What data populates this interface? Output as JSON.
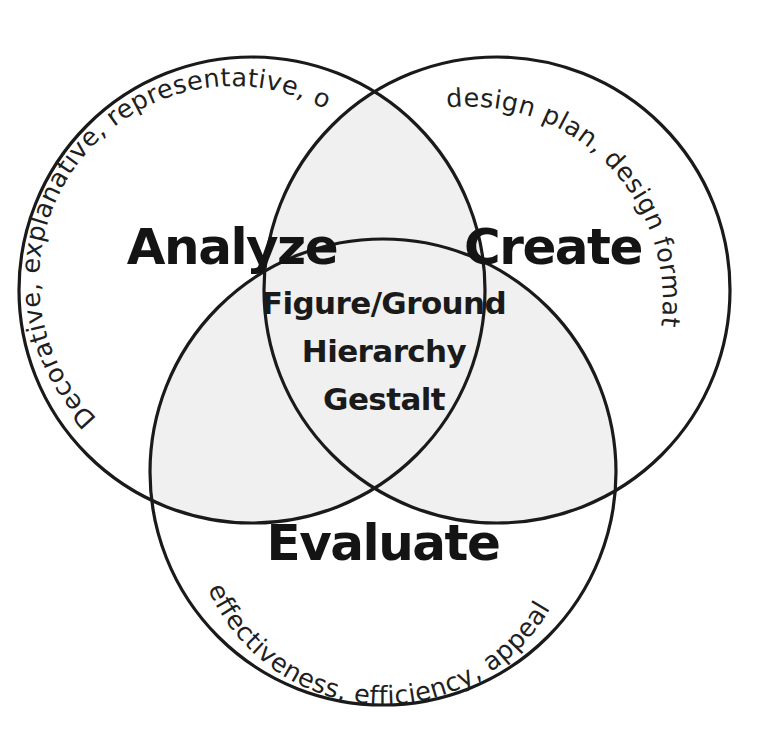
{
  "diagram": {
    "type": "three-set-venn",
    "background_color": "#ffffff",
    "stroke_color": "#1a1a1a",
    "overlap_fill_color": "#f0f0f0",
    "text_color": "#141414"
  },
  "sets": {
    "analyze": {
      "label": "Analyze",
      "descriptor": "Decorative, explanative, representative, organizational",
      "cx": 252,
      "cy": 290,
      "r": 233
    },
    "create": {
      "label": "Create",
      "descriptor": "design plan,  design format",
      "cx": 497,
      "cy": 290,
      "r": 233
    },
    "evaluate": {
      "label": "Evaluate",
      "descriptor": "effectiveness, efficiency, appeal",
      "cx": 383,
      "cy": 472,
      "r": 233
    }
  },
  "center": {
    "lines": [
      "Figure/Ground",
      "Hierarchy",
      "Gestalt"
    ]
  }
}
